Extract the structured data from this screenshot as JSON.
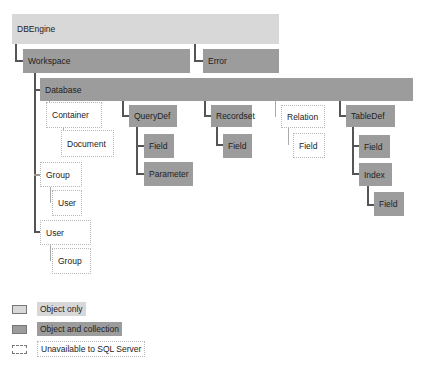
{
  "diagram": {
    "nodes": {
      "dbengine": "DBEngine",
      "workspace": "Workspace",
      "error": "Error",
      "database": "Database",
      "container": "Container",
      "document": "Document",
      "group": "Group",
      "group_user": "User",
      "user": "User",
      "user_group": "Group",
      "querydef": "QueryDef",
      "querydef_field": "Field",
      "parameter": "Parameter",
      "recordset": "Recordset",
      "recordset_field": "Field",
      "relation": "Relation",
      "relation_field": "Field",
      "tabledef": "TableDef",
      "tabledef_field": "Field",
      "index": "Index",
      "index_field": "Field"
    }
  },
  "legend": {
    "items": [
      {
        "label": "Object only",
        "style": "object",
        "color": "#d8d8d8"
      },
      {
        "label": "Object and collection",
        "style": "collection",
        "color": "#9c9c9c"
      },
      {
        "label": "Unavailable to SQL Server",
        "style": "dotted",
        "color": "#ffffff"
      }
    ]
  }
}
